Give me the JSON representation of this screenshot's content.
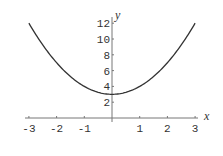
{
  "chart_data": {
    "type": "line",
    "title": "",
    "function": "y = x^2 + 3",
    "xlabel": "x",
    "ylabel": "y",
    "xlim": [
      -3,
      3
    ],
    "ylim": [
      0,
      12
    ],
    "x_ticks": [
      -3,
      -2,
      -1,
      1,
      2,
      3
    ],
    "x_tick_labels": [
      "-3",
      "-2",
      "-1",
      "1",
      "2",
      "3"
    ],
    "y_ticks": [
      2,
      4,
      6,
      8,
      10,
      12
    ],
    "y_tick_labels": [
      "2",
      "4",
      "6",
      "8",
      "10",
      "12"
    ],
    "grid": false,
    "legend": null,
    "series": [
      {
        "name": "y = x^2 + 3",
        "x": [
          -3,
          -2.5,
          -2,
          -1.5,
          -1,
          -0.5,
          0,
          0.5,
          1,
          1.5,
          2,
          2.5,
          3
        ],
        "y": [
          12,
          9.25,
          7,
          5.25,
          4,
          3.25,
          3,
          3.25,
          4,
          5.25,
          7,
          9.25,
          12
        ]
      }
    ],
    "colors": {
      "curve": "#333333",
      "axes": "#777777",
      "text": "#333333"
    }
  }
}
